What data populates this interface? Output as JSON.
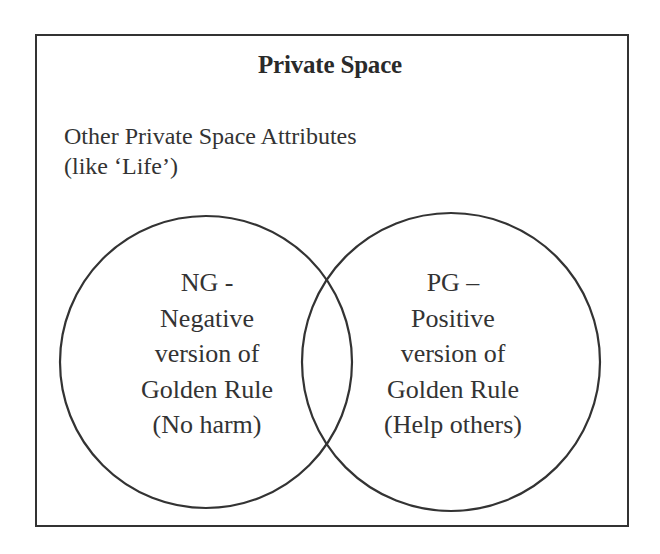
{
  "diagram": {
    "title": "Private Space",
    "subtitle_lines": [
      "Other Private Space Attributes",
      "(like ‘Life’)"
    ],
    "colors": {
      "border": "#333333",
      "text": "#333333",
      "background": "#ffffff"
    },
    "circles": [
      {
        "id": "NG",
        "lines": [
          "NG -",
          "Negative",
          "version of",
          "Golden Rule",
          "(No harm)"
        ]
      },
      {
        "id": "PG",
        "lines": [
          "PG –",
          "Positive",
          "version of",
          "Golden Rule",
          "(Help others)"
        ]
      }
    ]
  }
}
